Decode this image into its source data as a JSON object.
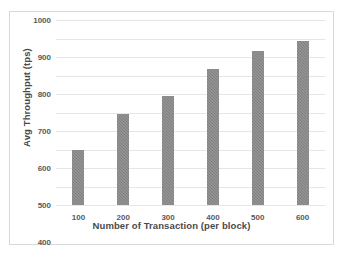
{
  "chart_data": {
    "type": "bar",
    "title": "",
    "xlabel": "Number of Transaction (per block)",
    "ylabel": "Avg Throughput (tps)",
    "categories": [
      "100",
      "200",
      "300",
      "400",
      "500",
      "600"
    ],
    "values": [
      300,
      490,
      590,
      735,
      835,
      885
    ],
    "ylim": [
      0,
      1000
    ],
    "yticks": [
      0,
      100,
      200,
      300,
      400,
      500,
      600,
      700,
      800,
      900,
      1000
    ],
    "ytick_labels": [
      "0",
      "100",
      "200",
      "300",
      "400",
      "500",
      "600",
      "700",
      "800",
      "900",
      "1000"
    ],
    "grid": true,
    "legend": "none",
    "series": [
      {
        "name": "Avg Throughput (tps)",
        "values": [
          300,
          490,
          590,
          735,
          835,
          885
        ]
      }
    ],
    "colors": {
      "bar": "#808080",
      "gridline": "#e6e6e6",
      "border": "#d9d9d9",
      "text": "#595959",
      "axis_title": "#4a4a4a",
      "background": "#ffffff"
    }
  }
}
